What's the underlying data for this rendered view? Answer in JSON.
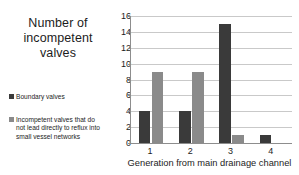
{
  "chart_data": {
    "type": "bar",
    "title": "Number of incompetent valves",
    "title_lines": [
      "Number of",
      "incompetent",
      "valves"
    ],
    "xlabel": "Generation from main drainage channel",
    "ylabel": "Number of incompetent valves",
    "categories": [
      "1",
      "2",
      "3",
      "4"
    ],
    "yticks": [
      "0",
      "2",
      "4",
      "6",
      "8",
      "10",
      "12",
      "14",
      "16"
    ],
    "ylim": [
      0,
      16
    ],
    "grid": true,
    "legend_position": "left",
    "series": [
      {
        "name": "Boundary valves",
        "color": "#3a3a3a",
        "values": [
          4,
          4,
          15,
          1
        ]
      },
      {
        "name": "Incompetent valves that do not lead directly to reflux into small vessel networks",
        "name_lines": [
          "Incompetent valves that do",
          "not lead directly to reflux into",
          "small vessel networks"
        ],
        "color": "#8a8a8a",
        "values": [
          9,
          9,
          1,
          0
        ]
      }
    ]
  },
  "legend": {
    "boundary": {
      "label": "Boundary valves",
      "swatch_color": "#3a3a3a",
      "swatch_icon": "square-marker-icon"
    },
    "incompetent": {
      "line1": "Incompetent valves that do",
      "line2": "not lead directly to reflux into",
      "line3": "small vessel networks",
      "swatch_color": "#8a8a8a",
      "swatch_icon": "square-marker-icon"
    }
  },
  "title": {
    "line1": "Number of",
    "line2": "incompetent",
    "line3": "valves"
  },
  "axes": {
    "x_title": "Generation from main drainage channel",
    "y_ticks": [
      "16",
      "14",
      "12",
      "10",
      "8",
      "6",
      "4",
      "2",
      "0"
    ],
    "x_ticks": [
      "1",
      "2",
      "3",
      "4"
    ]
  },
  "colors": {
    "series_dark": "#3a3a3a",
    "series_light": "#8a8a8a",
    "gridline": "#c9c9c9",
    "axis": "#8d8d8d",
    "text": "#1c1c1c",
    "background": "#ffffff"
  }
}
